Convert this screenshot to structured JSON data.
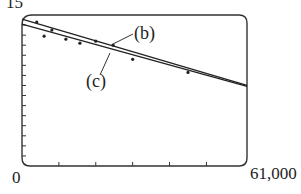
{
  "chart_data": {
    "type": "scatter",
    "title": "",
    "xlabel": "",
    "ylabel": "",
    "xlim": [
      0,
      61000
    ],
    "ylim": [
      0,
      15
    ],
    "x_tick_labels": [
      "0",
      "61,000"
    ],
    "y_tick_labels": [
      "15"
    ],
    "x_ticks_count": 5,
    "y_ticks_count": 14,
    "grid": false,
    "points": [
      {
        "x": 4000,
        "y": 14.3
      },
      {
        "x": 6000,
        "y": 12.9
      },
      {
        "x": 8100,
        "y": 13.5
      },
      {
        "x": 11900,
        "y": 12.6
      },
      {
        "x": 15700,
        "y": 12.2
      },
      {
        "x": 20000,
        "y": 12.4
      },
      {
        "x": 24700,
        "y": 12.0
      },
      {
        "x": 30000,
        "y": 10.6
      },
      {
        "x": 45000,
        "y": 9.3
      }
    ],
    "series": [
      {
        "name": "(b)",
        "type": "line",
        "x": [
          0,
          61000
        ],
        "y": [
          14.6,
          8.0
        ]
      },
      {
        "name": "(c)",
        "type": "line",
        "x": [
          0,
          61000
        ],
        "y": [
          14.1,
          7.9
        ]
      }
    ],
    "annotations": [
      {
        "text": "(b)",
        "points_to": "line (b)"
      },
      {
        "text": "(c)",
        "points_to": "line (c)"
      }
    ]
  },
  "labels": {
    "y_max": "15",
    "x_min": "0",
    "x_max": "61,000",
    "b": "(b)",
    "c": "(c)"
  }
}
